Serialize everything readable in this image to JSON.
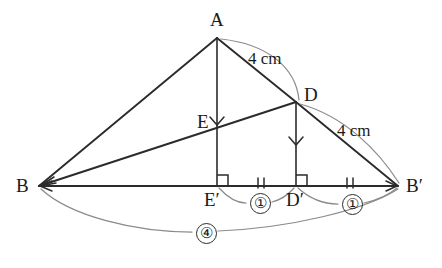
{
  "figure": {
    "background_color": "#ffffff",
    "line_color": "#2b2b2b",
    "arc_color": "#8a8a8a"
  },
  "vertices": [
    {
      "key": "A",
      "label": "A",
      "x": 217,
      "y": 38,
      "label_x": 210,
      "label_y": 10
    },
    {
      "key": "B",
      "label": "B",
      "x": 39,
      "y": 186,
      "label_x": 16,
      "label_y": 176
    },
    {
      "key": "Bp",
      "label": "B′",
      "x": 398,
      "y": 186,
      "label_x": 406,
      "label_y": 176
    },
    {
      "key": "D",
      "label": "D",
      "x": 296,
      "y": 102,
      "label_x": 304,
      "label_y": 85
    },
    {
      "key": "E",
      "label": "E",
      "x": 217,
      "y": 124,
      "label_x": 197,
      "label_y": 112
    },
    {
      "key": "Ep",
      "label": "E′",
      "x": 217,
      "y": 186,
      "label_x": 204,
      "label_y": 190
    },
    {
      "key": "Dp",
      "label": "D′",
      "x": 296,
      "y": 186,
      "label_x": 286,
      "label_y": 190
    }
  ],
  "segment_labels": [
    {
      "key": "ad_len",
      "text": "4 cm",
      "x": 248,
      "y": 50
    },
    {
      "key": "db_len",
      "text": "4 cm",
      "x": 337,
      "y": 122
    }
  ],
  "ratio_labels": [
    {
      "key": "ratio_ep_dp",
      "text": "①",
      "x": 250,
      "y": 193
    },
    {
      "key": "ratio_dp_bp",
      "text": "①",
      "x": 342,
      "y": 194
    },
    {
      "key": "ratio_b_bp",
      "text": "④",
      "x": 196,
      "y": 223
    }
  ],
  "markers": {
    "tick_marks": [
      {
        "key": "tick-ep-dp",
        "x": 261,
        "y": 183
      },
      {
        "key": "tick-dp-bp",
        "x": 350,
        "y": 183
      }
    ],
    "right_angles": [
      {
        "key": "right-angle-ep",
        "x": 217,
        "y": 186
      },
      {
        "key": "right-angle-dp",
        "x": 296,
        "y": 186
      }
    ],
    "arrow_chevrons": [
      {
        "key": "chevron-a-ep",
        "x": 217,
        "y": 123
      },
      {
        "key": "chevron-d-dp",
        "x": 296,
        "y": 143
      }
    ]
  }
}
